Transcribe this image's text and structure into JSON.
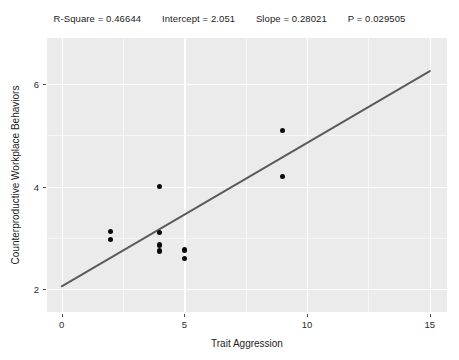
{
  "stats": {
    "items": [
      {
        "label": "R-Square = 0.46644"
      },
      {
        "label": "Intercept = 2.051"
      },
      {
        "label": "Slope = 0.28021"
      },
      {
        "label": "P = 0.029505"
      }
    ]
  },
  "chart_data": {
    "type": "scatter",
    "title": "R-Square = 0.46644    Intercept = 2.051    Slope = 0.28021    P = 0.029505",
    "xlabel": "Trait Aggression",
    "ylabel": "Counterproductive Workplace Behaviors",
    "xlim": [
      -0.6,
      15.7
    ],
    "ylim": [
      1.55,
      6.9
    ],
    "xticks": [
      0,
      5,
      10,
      15
    ],
    "xtick_labels": [
      "0",
      "5",
      "10",
      "15"
    ],
    "yticks": [
      2,
      4,
      6
    ],
    "ytick_labels": [
      "2",
      "4",
      "6"
    ],
    "x_minor_ticks": [
      2.5,
      7.5,
      12.5
    ],
    "y_minor_ticks": [
      3,
      5,
      6
    ],
    "grid": true,
    "legend": false,
    "panel_background": "#ebebeb",
    "gridline_color": "#ffffff",
    "point_color": "#0a0a0a",
    "line_color": "#5a5a5a",
    "points": [
      {
        "x": 2.0,
        "y": 3.12
      },
      {
        "x": 2.0,
        "y": 2.97
      },
      {
        "x": 4.0,
        "y": 4.0
      },
      {
        "x": 4.0,
        "y": 3.1
      },
      {
        "x": 4.0,
        "y": 2.86
      },
      {
        "x": 4.0,
        "y": 2.74
      },
      {
        "x": 5.0,
        "y": 2.76
      },
      {
        "x": 5.0,
        "y": 2.6
      },
      {
        "x": 9.0,
        "y": 5.1
      },
      {
        "x": 9.0,
        "y": 4.2
      }
    ],
    "fit_line": {
      "intercept": 2.051,
      "slope": 0.28021,
      "x_start": 0.0,
      "x_end": 15.0,
      "y_start": 2.051,
      "y_end": 6.254
    },
    "statistics": {
      "r_square": 0.46644,
      "intercept": 2.051,
      "slope": 0.28021,
      "p_value": 0.029505
    }
  },
  "axes": {
    "x_title": "Trait Aggression",
    "y_title": "Counterproductive Workplace Behaviors"
  }
}
